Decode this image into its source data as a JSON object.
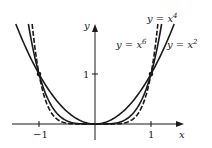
{
  "chart_data": {
    "type": "line",
    "title": "",
    "xlabel": "x",
    "ylabel": "y",
    "xlim": [
      -1.4,
      1.5
    ],
    "ylim": [
      0,
      2.0
    ],
    "x_ticks": [
      {
        "value": -1,
        "label": "−1"
      },
      {
        "value": 1,
        "label": "1"
      }
    ],
    "y_ticks": [
      {
        "value": 1,
        "label": "1"
      }
    ],
    "grid": false,
    "legend": "inline labels",
    "series": [
      {
        "name": "y = x^2",
        "label_base": "y = x",
        "exponent": "2",
        "power": 2,
        "style": "solid"
      },
      {
        "name": "y = x^4",
        "label_base": "y = x",
        "exponent": "4",
        "power": 4,
        "style": "solid"
      },
      {
        "name": "y = x^6",
        "label_base": "y = x",
        "exponent": "6",
        "power": 6,
        "style": "dashed"
      }
    ],
    "highlighted_points": [
      {
        "x": -1,
        "y": 1
      },
      {
        "x": 1,
        "y": 1
      }
    ]
  },
  "layout": {
    "origin_px": [
      95,
      124
    ],
    "x_unit_px": 56,
    "y_unit_px": 50,
    "color": "#1a1a1a"
  }
}
